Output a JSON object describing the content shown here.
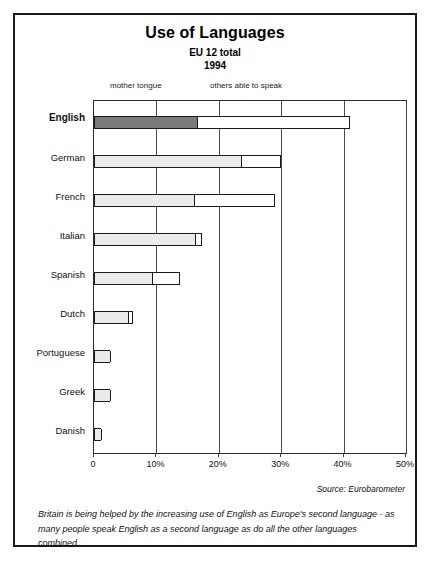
{
  "figure": {
    "title": "Use of Languages",
    "subtitle_1": "EU 12 total",
    "subtitle_2": "1994",
    "source": "Source: Eurobarometer",
    "caption": "Britain is being helped by the increasing use of English as Europe's second language - as many people speak English as a second language as do all the other languages combined."
  },
  "legend": {
    "mother_tongue": "mother tongue",
    "others_able_to_speak": "others able to speak"
  },
  "axis": {
    "ticks": [
      "0",
      "10%",
      "20%",
      "30%",
      "40%",
      "50%"
    ],
    "tick_values": [
      0,
      10,
      20,
      30,
      40,
      50
    ]
  },
  "colors": {
    "highlight_fill": "#7a7a7a",
    "normal_fill": "#ebebeb",
    "bar_outline": "#1a1a1a",
    "frame": "#1a1a1a",
    "grid": "#4a4a4a",
    "background": "#ffffff"
  },
  "chart_data": {
    "type": "bar",
    "orientation": "horizontal",
    "stacked": true,
    "title": "Use of Languages",
    "subtitle": "EU 12 total 1994",
    "xlabel": "",
    "ylabel": "",
    "xlim": [
      0,
      50
    ],
    "grid": true,
    "legend_position": "above-plot",
    "categories": [
      "English",
      "German",
      "French",
      "Italian",
      "Spanish",
      "Dutch",
      "Portuguese",
      "Greek",
      "Danish"
    ],
    "series": [
      {
        "name": "mother tongue",
        "values": [
          16.5,
          23.5,
          16.0,
          16.2,
          9.3,
          5.5,
          2.5,
          2.5,
          1.1
        ]
      },
      {
        "name": "others able to speak",
        "values": [
          24.5,
          6.5,
          13.0,
          1.1,
          4.5,
          0.7,
          0.0,
          0.0,
          0.0
        ]
      }
    ],
    "totals": [
      41.0,
      30.0,
      29.0,
      17.3,
      13.8,
      6.2,
      2.5,
      2.5,
      1.1
    ],
    "units": "percent",
    "highlighted_category": "English",
    "annotations": [
      "Source: Eurobarometer"
    ]
  }
}
